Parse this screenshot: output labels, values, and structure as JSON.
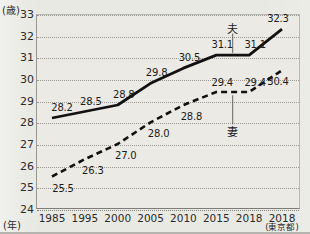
{
  "chart_data": {
    "type": "line",
    "title": "",
    "xlabel": "(年)",
    "ylabel": "(歳)",
    "ylim": [
      24,
      33
    ],
    "grid": true,
    "legend_position": "inline-annotation",
    "categories": [
      "1985",
      "1995",
      "2000",
      "2005",
      "2010",
      "2015",
      "2018",
      "2018"
    ],
    "category_sublabels": [
      "",
      "",
      "",
      "",
      "",
      "",
      "",
      "(東京都)"
    ],
    "yticks": [
      "33",
      "32",
      "31",
      "30",
      "29",
      "28",
      "27",
      "26",
      "25",
      "24"
    ],
    "series": [
      {
        "name": "夫",
        "style": "solid",
        "color": "#111111",
        "values": [
          28.2,
          28.5,
          28.8,
          29.8,
          30.5,
          31.1,
          31.1,
          32.3
        ],
        "value_labels": [
          "28.2",
          "28.5",
          "28.8",
          "29.8",
          "30.5",
          "31.1",
          "31.1",
          "32.3"
        ]
      },
      {
        "name": "妻",
        "style": "dashed",
        "color": "#111111",
        "values": [
          25.5,
          26.3,
          27.0,
          28.0,
          28.8,
          29.4,
          29.4,
          30.4
        ],
        "value_labels": [
          "25.5",
          "26.3",
          "27.0",
          "28.0",
          "28.8",
          "29.4",
          "29.4",
          "30.4"
        ]
      }
    ]
  },
  "axes": {
    "y_unit": "(歳)",
    "x_unit": "(年)"
  },
  "annotations": {
    "husband_label": "夫",
    "wife_label": "妻"
  }
}
